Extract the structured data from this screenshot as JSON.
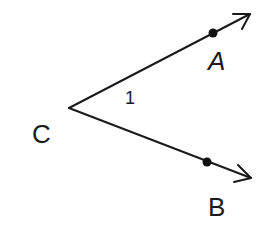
{
  "diagram": {
    "type": "angle",
    "vertex": {
      "name": "C",
      "label": "C",
      "x": 69,
      "y": 108,
      "label_x": 32,
      "label_y": 143
    },
    "rays": [
      {
        "id": "ray-CA",
        "from": "C",
        "through": "A",
        "point": {
          "name": "A",
          "label": "A",
          "x": 213,
          "y": 33,
          "label_x": 218,
          "label_y": 70
        },
        "tip": {
          "x": 250,
          "y": 14
        },
        "arrowhead": [
          [
            233,
            14
          ],
          [
            250,
            14
          ],
          [
            242,
            29
          ]
        ]
      },
      {
        "id": "ray-CB",
        "from": "C",
        "through": "B",
        "point": {
          "name": "B",
          "label": "B",
          "x": 207,
          "y": 162,
          "label_x": 219,
          "label_y": 216
        },
        "tip": {
          "x": 251,
          "y": 178
        },
        "arrowhead": [
          [
            238,
            165
          ],
          [
            251,
            178
          ],
          [
            234,
            182
          ]
        ]
      }
    ],
    "angle_label": {
      "text": "1",
      "x": 131,
      "y": 104
    },
    "colors": {
      "stroke": "#1a1a1a",
      "background": "#ffffff"
    }
  }
}
